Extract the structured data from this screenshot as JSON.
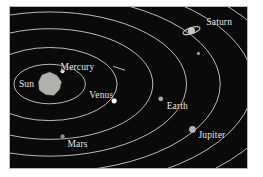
{
  "figure": {
    "background_color": "#0a0a0a",
    "frame_color": "#b9b9b9",
    "page_color": "#ffffff"
  },
  "diagram": {
    "type": "solar-system-orbital-diagram",
    "orbit_color": "#cfcdc6",
    "label_color": "#eceae4",
    "view": {
      "width": 239,
      "height": 163
    },
    "sun": {
      "label": "Sun",
      "color": "#b2b0ac",
      "center_x": 40,
      "center_y": 78,
      "radius": 12,
      "shape": "polygon",
      "label_x": 9,
      "label_y": 74
    },
    "orbits": [
      {
        "name": "mercury-orbit",
        "cx": 40,
        "cy": 78,
        "rx": 36,
        "ry": 20
      },
      {
        "name": "venus-orbit",
        "cx": 40,
        "cy": 78,
        "rx": 68,
        "ry": 37
      },
      {
        "name": "earth-orbit",
        "cx": 40,
        "cy": 78,
        "rx": 104,
        "ry": 56
      },
      {
        "name": "mars-orbit",
        "cx": 40,
        "cy": 78,
        "rx": 138,
        "ry": 73
      },
      {
        "name": "jupiter-orbit",
        "cx": 40,
        "cy": 78,
        "rx": 172,
        "ry": 89
      },
      {
        "name": "saturn-orbit",
        "cx": 40,
        "cy": 78,
        "rx": 205,
        "ry": 105
      },
      {
        "name": "uranus-orbit",
        "cx": 40,
        "cy": 78,
        "rx": 236,
        "ry": 121
      },
      {
        "name": "neptune-orbit",
        "cx": 40,
        "cy": 78,
        "rx": 266,
        "ry": 137
      },
      {
        "name": "pluto-orbit",
        "cx": 40,
        "cy": 78,
        "rx": 296,
        "ry": 153
      }
    ],
    "planets": [
      {
        "name": "mercury",
        "label": "Mercury",
        "color": "#f2f1ed",
        "x": 53,
        "y": 65,
        "radius": 2.0,
        "label_x": 51,
        "label_y": 57,
        "leader": {
          "x1": 104,
          "y1": 60,
          "x2": 116,
          "y2": 64
        }
      },
      {
        "name": "venus",
        "label": "Venus",
        "color": "#ffffff",
        "x": 105,
        "y": 95,
        "radius": 2.6,
        "label_x": 80,
        "label_y": 85,
        "leader": null
      },
      {
        "name": "earth",
        "label": "Earth",
        "color": "#a9a7a2",
        "x": 152,
        "y": 93,
        "radius": 2.4,
        "label_x": 158,
        "label_y": 96,
        "leader": null
      },
      {
        "name": "mars",
        "label": "Mars",
        "color": "#8e8c88",
        "x": 53,
        "y": 131,
        "radius": 2.2,
        "label_x": 58,
        "label_y": 135,
        "leader": null
      },
      {
        "name": "jupiter",
        "label": "Jupiter",
        "color": "#b5b3ae",
        "x": 184,
        "y": 124,
        "radius": 3.4,
        "label_x": 190,
        "label_y": 126,
        "leader": null
      },
      {
        "name": "saturn",
        "label": "Saturn",
        "color": "#c8c6c0",
        "x": 183,
        "y": 24,
        "radius": 3.6,
        "has_rings": true,
        "ring_rx": 9,
        "ring_ry": 3,
        "ring_tilt": -18,
        "label_x": 198,
        "label_y": 11,
        "leader": null
      },
      {
        "name": "uranus",
        "label": "",
        "color": "#9d9b96",
        "x": 190,
        "y": 47,
        "radius": 1.6,
        "label_x": 0,
        "label_y": 0,
        "leader": null
      }
    ]
  }
}
